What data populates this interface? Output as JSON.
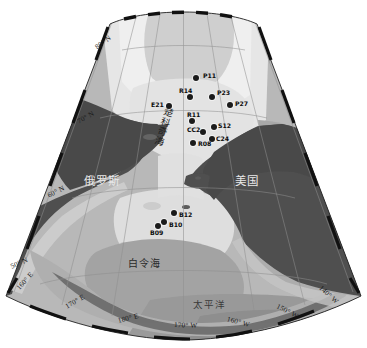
{
  "figure": {
    "kind": "map",
    "projection": "conic",
    "extent_note": "Chukchi Sea and Bering Sea sampling stations"
  },
  "colors": {
    "ocean_shelf": "#d9d9d9",
    "ocean_deep": "#9e9e9e",
    "ocean_mid": "#bdbdbd",
    "land": "#4d4d4d",
    "ice": "#ededed",
    "graticule": "#8c8c8c",
    "border_tick": "#111111",
    "station": "#1b1b1b",
    "background": "#ffffff"
  },
  "graticule": {
    "latitude_labels": [
      {
        "text": "80° N",
        "x": 96,
        "y": 44,
        "rot": -37
      },
      {
        "text": "70° N",
        "x": 78,
        "y": 118,
        "rot": -30
      },
      {
        "text": "60° N",
        "x": 48,
        "y": 192,
        "rot": -27
      },
      {
        "text": "50° N",
        "x": 11,
        "y": 263,
        "rot": -24
      }
    ],
    "longitude_labels": [
      {
        "text": "160° E",
        "x": 18,
        "y": 285,
        "rot": -48
      },
      {
        "text": "170° E",
        "x": 66,
        "y": 303,
        "rot": -30
      },
      {
        "text": "180° E",
        "x": 118,
        "y": 317,
        "rot": -14
      },
      {
        "text": "170° W",
        "x": 174,
        "y": 321,
        "rot": 2
      },
      {
        "text": "160° W",
        "x": 227,
        "y": 315,
        "rot": 15
      },
      {
        "text": "150° W",
        "x": 277,
        "y": 302,
        "rot": 27
      },
      {
        "text": "140° W",
        "x": 320,
        "y": 283,
        "rot": 42
      }
    ]
  },
  "places": [
    {
      "name": "russia",
      "text": "俄罗斯",
      "x": 84,
      "y": 172,
      "style": "country"
    },
    {
      "name": "usa",
      "text": "美国",
      "x": 235,
      "y": 172,
      "style": "country"
    },
    {
      "name": "bering-sea",
      "text": "白令海",
      "x": 128,
      "y": 255,
      "style": "sea"
    },
    {
      "name": "pacific-ocean",
      "text": "太平洋",
      "x": 193,
      "y": 297,
      "style": "sea-light"
    }
  ],
  "vertical_places": [
    {
      "name": "chukchi-sea",
      "text": "楚科奇海",
      "x": 165,
      "y": 108,
      "rot": 18
    }
  ],
  "stations": [
    {
      "id": "P11",
      "x": 196,
      "y": 78,
      "lx": 203,
      "ly": 75
    },
    {
      "id": "R14",
      "x": 190,
      "y": 97,
      "lx": 181,
      "ly": 90
    },
    {
      "id": "P23",
      "x": 212,
      "y": 97,
      "lx": 218,
      "ly": 92
    },
    {
      "id": "P27",
      "x": 230,
      "y": 105,
      "lx": 236,
      "ly": 103
    },
    {
      "id": "E21",
      "x": 169,
      "y": 106,
      "lx": 153,
      "ly": 103
    },
    {
      "id": "R11",
      "x": 192,
      "y": 121,
      "lx": 188,
      "ly": 113
    },
    {
      "id": "CC2",
      "x": 203,
      "y": 132,
      "lx": 195,
      "ly": 126
    },
    {
      "id": "S12",
      "x": 214,
      "y": 127,
      "lx": 218,
      "ly": 123
    },
    {
      "id": "C24",
      "x": 212,
      "y": 139,
      "lx": 217,
      "ly": 137
    },
    {
      "id": "R08",
      "x": 193,
      "y": 143,
      "lx": 199,
      "ly": 142
    },
    {
      "id": "B12",
      "x": 174,
      "y": 213,
      "lx": 180,
      "ly": 213
    },
    {
      "id": "B10",
      "x": 164,
      "y": 222,
      "lx": 170,
      "ly": 223
    },
    {
      "id": "B09",
      "x": 158,
      "y": 226,
      "lx": 152,
      "ly": 230
    }
  ]
}
